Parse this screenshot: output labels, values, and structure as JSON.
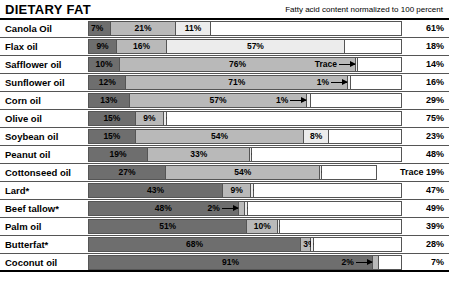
{
  "header": {
    "title": "DIETARY FAT",
    "subtitle": "Fatty acid content normalized to 100 percent"
  },
  "colors": {
    "saturated": "#6e6e6e",
    "mono": "#b9b9b9",
    "poly_linoleic": "#d6d6d6",
    "poly_alpha_linolenic": "#ececec",
    "remainder": "#ffffff",
    "rule": "#555555",
    "text": "#000000"
  },
  "chart_data": {
    "type": "bar",
    "orientation": "horizontal",
    "stacked": true,
    "normalized_to": 100,
    "title": "DIETARY FAT",
    "subtitle": "Fatty acid content normalized to 100 percent",
    "xlabel": "",
    "ylabel": "",
    "xlim": [
      0,
      100
    ],
    "grid": false,
    "legend": "none",
    "categories": [
      "Canola Oil",
      "Flax oil",
      "Safflower oil",
      "Sunflower oil",
      "Corn oil",
      "Olive oil",
      "Soybean oil",
      "Peanut oil",
      "Cottonseed oil",
      "Lard*",
      "Beef tallow*",
      "Palm oil",
      "Butterfat*",
      "Coconut oil"
    ],
    "series": [
      {
        "name": "segment-1",
        "values": [
          7,
          9,
          10,
          12,
          13,
          15,
          15,
          19,
          27,
          43,
          48,
          51,
          68,
          91
        ]
      },
      {
        "name": "segment-2",
        "values": [
          21,
          16,
          76,
          71,
          57,
          9,
          54,
          33,
          54,
          9,
          2,
          10,
          3,
          2
        ]
      },
      {
        "name": "segment-3",
        "values": [
          11,
          57,
          0.4,
          1,
          1,
          1,
          8,
          0.4,
          0.4,
          1,
          1,
          0.4,
          1,
          0
        ]
      },
      {
        "name": "segment-4",
        "values": [
          61,
          18,
          14,
          16,
          29,
          75,
          23,
          48,
          19,
          47,
          49,
          39,
          28,
          7
        ]
      }
    ]
  },
  "rows": [
    {
      "name": "Canola Oil",
      "total": "61%",
      "segments": [
        {
          "value": 7,
          "label": "7%",
          "shade": "saturated"
        },
        {
          "value": 21,
          "label": "21%",
          "shade": "mono"
        },
        {
          "value": 11,
          "label": "11%",
          "shade": "poly_alpha_linolenic"
        },
        {
          "value": 61,
          "label": "",
          "shade": "remainder"
        }
      ]
    },
    {
      "name": "Flax oil",
      "total": "18%",
      "segments": [
        {
          "value": 9,
          "label": "9%",
          "shade": "saturated"
        },
        {
          "value": 16,
          "label": "16%",
          "shade": "mono"
        },
        {
          "value": 57,
          "label": "57%",
          "shade": "poly_alpha_linolenic"
        },
        {
          "value": 18,
          "label": "",
          "shade": "remainder"
        }
      ]
    },
    {
      "name": "Safflower oil",
      "total": "14%",
      "segments": [
        {
          "value": 10,
          "label": "10%",
          "shade": "saturated"
        },
        {
          "value": 76,
          "label": "76%",
          "shade": "mono"
        },
        {
          "value": 0.5,
          "label": "Trace",
          "shade": "poly_alpha_linolenic",
          "callout": "to-right"
        },
        {
          "value": 14,
          "label": "",
          "shade": "remainder"
        }
      ]
    },
    {
      "name": "Sunflower oil",
      "total": "16%",
      "segments": [
        {
          "value": 12,
          "label": "12%",
          "shade": "saturated"
        },
        {
          "value": 71,
          "label": "71%",
          "shade": "mono"
        },
        {
          "value": 1,
          "label": "1%",
          "shade": "poly_alpha_linolenic",
          "callout": "to-right"
        },
        {
          "value": 16,
          "label": "",
          "shade": "remainder"
        }
      ]
    },
    {
      "name": "Corn oil",
      "total": "29%",
      "segments": [
        {
          "value": 13,
          "label": "13%",
          "shade": "saturated"
        },
        {
          "value": 57,
          "label": "57%",
          "shade": "mono"
        },
        {
          "value": 1,
          "label": "1%",
          "shade": "poly_alpha_linolenic",
          "callout": "to-right"
        },
        {
          "value": 29,
          "label": "",
          "shade": "remainder"
        }
      ]
    },
    {
      "name": "Olive oil",
      "total": "75%",
      "segments": [
        {
          "value": 15,
          "label": "15%",
          "shade": "saturated"
        },
        {
          "value": 9,
          "label": "9%",
          "shade": "mono"
        },
        {
          "value": 1,
          "label": "1%",
          "shade": "poly_alpha_linolenic",
          "callout": "to-left"
        },
        {
          "value": 75,
          "label": "",
          "shade": "remainder"
        }
      ]
    },
    {
      "name": "Soybean oil",
      "total": "23%",
      "segments": [
        {
          "value": 15,
          "label": "15%",
          "shade": "saturated"
        },
        {
          "value": 54,
          "label": "54%",
          "shade": "mono"
        },
        {
          "value": 8,
          "label": "8%",
          "shade": "poly_alpha_linolenic"
        },
        {
          "value": 23,
          "label": "",
          "shade": "remainder"
        }
      ]
    },
    {
      "name": "Peanut oil",
      "total": "48%",
      "segments": [
        {
          "value": 19,
          "label": "19%",
          "shade": "saturated"
        },
        {
          "value": 33,
          "label": "33%",
          "shade": "mono"
        },
        {
          "value": 0.5,
          "label": "Trace",
          "shade": "poly_alpha_linolenic",
          "callout": "to-left"
        },
        {
          "value": 48,
          "label": "",
          "shade": "remainder"
        }
      ]
    },
    {
      "name": "Cottonseed oil",
      "total": "Trace 19%",
      "total_wide": true,
      "segments": [
        {
          "value": 27,
          "label": "27%",
          "shade": "saturated"
        },
        {
          "value": 54,
          "label": "54%",
          "shade": "mono"
        },
        {
          "value": 0.5,
          "label": "",
          "shade": "poly_alpha_linolenic",
          "callout": "bare-left"
        },
        {
          "value": 19,
          "label": "",
          "shade": "remainder"
        }
      ]
    },
    {
      "name": "Lard*",
      "total": "47%",
      "segments": [
        {
          "value": 43,
          "label": "43%",
          "shade": "saturated"
        },
        {
          "value": 9,
          "label": "9%",
          "shade": "mono"
        },
        {
          "value": 1,
          "label": "1%",
          "shade": "poly_alpha_linolenic",
          "callout": "to-left"
        },
        {
          "value": 47,
          "label": "",
          "shade": "remainder"
        }
      ]
    },
    {
      "name": "Beef tallow*",
      "total": "49%",
      "segments": [
        {
          "value": 48,
          "label": "48%",
          "shade": "saturated"
        },
        {
          "value": 2,
          "label": "2%",
          "shade": "mono",
          "callout": "to-right"
        },
        {
          "value": 1,
          "label": "1%",
          "shade": "poly_alpha_linolenic",
          "callout": "to-left"
        },
        {
          "value": 49,
          "label": "",
          "shade": "remainder"
        }
      ]
    },
    {
      "name": "Palm oil",
      "total": "39%",
      "segments": [
        {
          "value": 51,
          "label": "51%",
          "shade": "saturated"
        },
        {
          "value": 10,
          "label": "10%",
          "shade": "mono"
        },
        {
          "value": 0.5,
          "label": "Trace",
          "shade": "poly_alpha_linolenic",
          "callout": "to-left"
        },
        {
          "value": 39,
          "label": "",
          "shade": "remainder"
        }
      ]
    },
    {
      "name": "Butterfat*",
      "total": "28%",
      "segments": [
        {
          "value": 68,
          "label": "68%",
          "shade": "saturated"
        },
        {
          "value": 3,
          "label": "3%",
          "shade": "mono"
        },
        {
          "value": 1,
          "label": "1%",
          "shade": "poly_alpha_linolenic",
          "callout": "to-left"
        },
        {
          "value": 28,
          "label": "",
          "shade": "remainder"
        }
      ]
    },
    {
      "name": "Coconut oil",
      "total": "7%",
      "segments": [
        {
          "value": 91,
          "label": "91%",
          "shade": "saturated"
        },
        {
          "value": 2,
          "label": "2%",
          "shade": "mono",
          "callout": "to-right"
        },
        {
          "value": 7,
          "label": "",
          "shade": "remainder"
        }
      ]
    }
  ]
}
